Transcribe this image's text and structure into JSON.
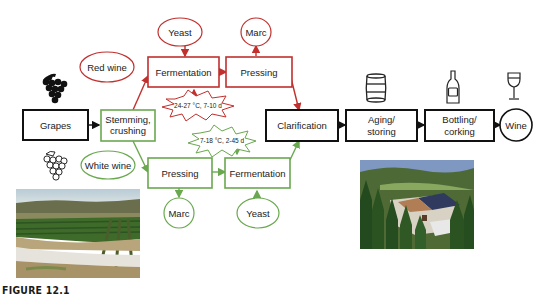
{
  "figure": {
    "caption": "FIGURE 12.1",
    "colors": {
      "red_path": "#c0302e",
      "white_path": "#6aa84f",
      "common": "#111111"
    }
  },
  "nodes": {
    "grapes": "Grapes",
    "stemming_line1": "Stemming,",
    "stemming_line2": "crushing",
    "red_wine": "Red wine",
    "white_wine": "White wine",
    "red_fermentation": "Fermentation",
    "red_pressing": "Pressing",
    "red_yeast": "Yeast",
    "red_marc": "Marc",
    "white_pressing": "Pressing",
    "white_fermentation": "Fermentation",
    "white_marc": "Marc",
    "white_yeast": "Yeast",
    "clarification": "Clarification",
    "aging_line1": "Aging/",
    "aging_line2": "storing",
    "bottling_line1": "Bottling/",
    "bottling_line2": "corking",
    "wine": "Wine"
  },
  "conditions": {
    "red": "24-27 °C, 7-10 d",
    "white": "7-18 °C, 2-45 d"
  },
  "icons": [
    "red-grapes-icon",
    "white-grapes-icon",
    "barrel-icon",
    "bottle-icon",
    "wine-glass-icon"
  ],
  "photos": [
    "vineyard-photo",
    "winery-estate-photo"
  ]
}
